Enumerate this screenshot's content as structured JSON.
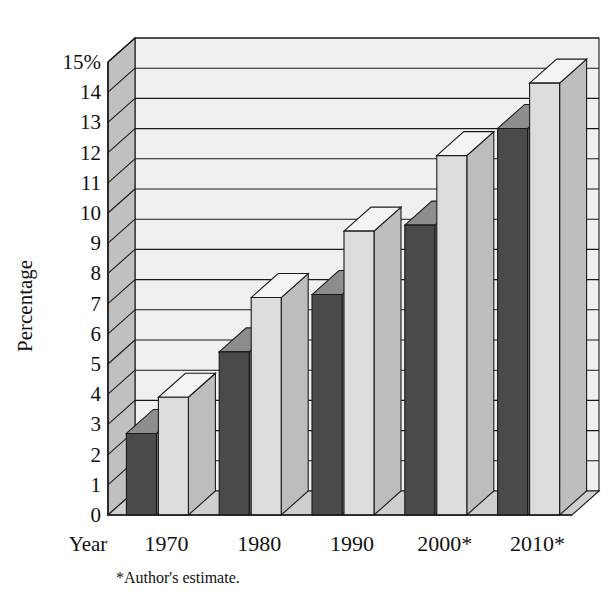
{
  "chart_data": {
    "type": "bar",
    "title": "",
    "subtitle": "",
    "xlabel": "Year",
    "ylabel": "Percentage",
    "categories": [
      "1970",
      "1980",
      "1990",
      "2000*",
      "2010*"
    ],
    "series": [
      {
        "name": "dark-series",
        "values": [
          2.7,
          5.4,
          7.3,
          9.6,
          12.8
        ],
        "color": "#4a4a4a"
      },
      {
        "name": "light-series",
        "values": [
          3.9,
          7.2,
          9.4,
          11.9,
          14.3
        ],
        "color": "#dcdcdc"
      }
    ],
    "ylim": [
      0,
      15
    ],
    "ytick_values": [
      0,
      1,
      2,
      3,
      4,
      5,
      6,
      7,
      8,
      9,
      10,
      11,
      12,
      13,
      14,
      15
    ],
    "ytick_labels": [
      "0",
      "1",
      "2",
      "3",
      "4",
      "5",
      "6",
      "7",
      "8",
      "9",
      "10",
      "11",
      "12",
      "13",
      "14",
      "15%"
    ],
    "grid": true,
    "legend": "none",
    "annotations": [
      "*Author's estimate."
    ],
    "style": "3d-column"
  },
  "axes": {
    "y_title": "Percentage",
    "x_title": "Year",
    "y_tick_labels": [
      "15%",
      "14",
      "13",
      "12",
      "11",
      "10",
      "9",
      "8",
      "7",
      "6",
      "5",
      "4",
      "3",
      "2",
      "1",
      "0"
    ],
    "x_tick_labels": [
      "1970",
      "1980",
      "1990",
      "2000*",
      "2010*"
    ]
  },
  "footnote": {
    "text": "*Author's estimate."
  },
  "colors": {
    "bar_dark_front": "#4a4a4a",
    "bar_dark_side": "#6f6f6f",
    "bar_dark_top": "#8d8d8d",
    "bar_light_front": "#dcdcdc",
    "bar_light_side": "#bdbdbd",
    "bar_light_top": "#f4f4f4",
    "wall_back": "#f0f0f0",
    "wall_left": "#c0c0c0",
    "floor": "#cfcfcf",
    "outline": "#1a1a1a"
  }
}
